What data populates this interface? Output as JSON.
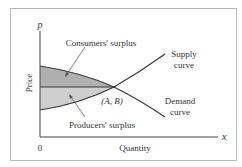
{
  "diagram": {
    "type": "supply-demand",
    "colors": {
      "frame": "#b8b8b8",
      "axis": "#444444",
      "curve": "#3a3a3a",
      "consumers_fill": "#b0b0b0",
      "producers_fill": "#cfcfcf",
      "text": "#333333"
    },
    "axes": {
      "y_symbol": "p",
      "x_symbol": "x",
      "y_title": "Price",
      "x_title": "Quantity",
      "origin": "0"
    },
    "curves": {
      "supply": {
        "line1": "Supply",
        "line2": "curve"
      },
      "demand": {
        "line1": "Demand",
        "line2": "curve"
      }
    },
    "equilibrium": {
      "label": "(A, B)"
    },
    "regions": {
      "consumers": {
        "label": "Consumers' surplus"
      },
      "producers": {
        "label": "Producers' surplus"
      }
    }
  }
}
